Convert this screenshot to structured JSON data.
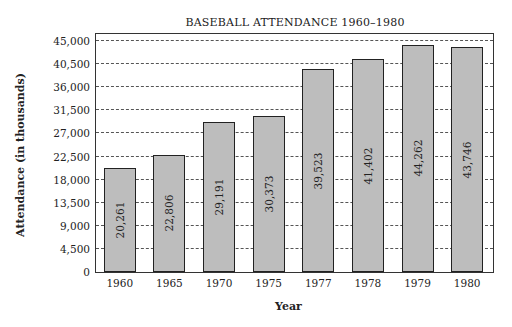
{
  "chart_data": {
    "type": "bar",
    "title": "BASEBALL ATTENDANCE 1960–1980",
    "xlabel": "Year",
    "ylabel": "Attendance (in thousands)",
    "categories": [
      "1960",
      "1965",
      "1970",
      "1975",
      "1977",
      "1978",
      "1979",
      "1980"
    ],
    "values": [
      20261,
      22806,
      29191,
      30373,
      39523,
      41402,
      44262,
      43746
    ],
    "value_labels": [
      "20,261",
      "22,806",
      "29,191",
      "30,373",
      "39,523",
      "41,402",
      "44,262",
      "43,746"
    ],
    "yticks": [
      0,
      4500,
      9000,
      13500,
      18000,
      22500,
      27000,
      31500,
      36000,
      40500,
      45000
    ],
    "ytick_labels": [
      "0",
      "4,500",
      "9,000",
      "13,500",
      "18,000",
      "22,500",
      "27,000",
      "31,500",
      "36,000",
      "40,500",
      "45,000"
    ],
    "ylim": [
      0,
      46000
    ],
    "grid": true,
    "grid_style": "dashed horizontal",
    "bar_color": "#bdbdbd",
    "legend": null
  }
}
